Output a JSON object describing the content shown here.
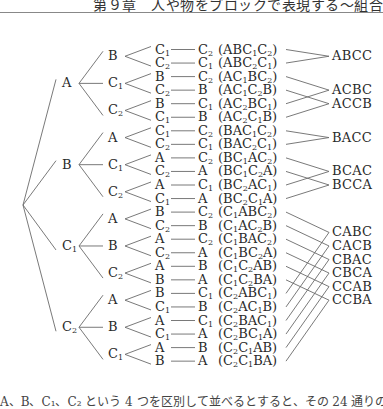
{
  "header": {
    "title": "第９章　人や物をブロックで表現する〜組合"
  },
  "tree": {
    "root": "",
    "level1": [
      "A",
      "B",
      "C1",
      "C2"
    ],
    "branches": [
      {
        "node": "A",
        "children": [
          {
            "node": "B",
            "leaves": [
              {
                "l3": "C1",
                "l4": "C2",
                "seq": "ABC1C2"
              },
              {
                "l3": "C2",
                "l4": "C1",
                "seq": "ABC2C1"
              }
            ]
          },
          {
            "node": "C1",
            "leaves": [
              {
                "l3": "B",
                "l4": "C2",
                "seq": "AC1BC2"
              },
              {
                "l3": "C2",
                "l4": "B",
                "seq": "AC1C2B"
              }
            ]
          },
          {
            "node": "C2",
            "leaves": [
              {
                "l3": "B",
                "l4": "C1",
                "seq": "AC2BC1"
              },
              {
                "l3": "C1",
                "l4": "B",
                "seq": "AC2C1B"
              }
            ]
          }
        ]
      },
      {
        "node": "B",
        "children": [
          {
            "node": "A",
            "leaves": [
              {
                "l3": "C1",
                "l4": "C2",
                "seq": "BAC1C2"
              },
              {
                "l3": "C2",
                "l4": "C1",
                "seq": "BAC2C1"
              }
            ]
          },
          {
            "node": "C1",
            "leaves": [
              {
                "l3": "A",
                "l4": "C2",
                "seq": "BC1AC2"
              },
              {
                "l3": "C2",
                "l4": "A",
                "seq": "BC1C2A"
              }
            ]
          },
          {
            "node": "C2",
            "leaves": [
              {
                "l3": "A",
                "l4": "C1",
                "seq": "BC2AC1"
              },
              {
                "l3": "C1",
                "l4": "A",
                "seq": "BC2C1A"
              }
            ]
          }
        ]
      },
      {
        "node": "C1",
        "children": [
          {
            "node": "A",
            "leaves": [
              {
                "l3": "B",
                "l4": "C2",
                "seq": "C1ABC2"
              },
              {
                "l3": "C2",
                "l4": "B",
                "seq": "C1AC2B"
              }
            ]
          },
          {
            "node": "B",
            "leaves": [
              {
                "l3": "A",
                "l4": "C2",
                "seq": "C1BAC2"
              },
              {
                "l3": "C2",
                "l4": "A",
                "seq": "C1BC2A"
              }
            ]
          },
          {
            "node": "C2",
            "leaves": [
              {
                "l3": "A",
                "l4": "B",
                "seq": "C1C2AB"
              },
              {
                "l3": "B",
                "l4": "A",
                "seq": "C1C2BA"
              }
            ]
          }
        ]
      },
      {
        "node": "C2",
        "children": [
          {
            "node": "A",
            "leaves": [
              {
                "l3": "B",
                "l4": "C1",
                "seq": "C2ABC1"
              },
              {
                "l3": "C1",
                "l4": "B",
                "seq": "C2AC1B"
              }
            ]
          },
          {
            "node": "B",
            "leaves": [
              {
                "l3": "A",
                "l4": "C1",
                "seq": "C2BAC1"
              },
              {
                "l3": "C1",
                "l4": "A",
                "seq": "C2BC1A"
              }
            ]
          },
          {
            "node": "C1",
            "leaves": [
              {
                "l3": "A",
                "l4": "B",
                "seq": "C2C1AB"
              },
              {
                "l3": "B",
                "l4": "A",
                "seq": "C2C1BA"
              }
            ]
          }
        ]
      }
    ],
    "results": [
      {
        "label": "ABCC",
        "rows": [
          0,
          1
        ],
        "row_pos": 0.5
      },
      {
        "label": "ACBC",
        "rows": [
          2,
          4
        ],
        "row_pos": 3
      },
      {
        "label": "ACCB",
        "rows": [
          3,
          5
        ],
        "row_pos": 4
      },
      {
        "label": "BACC",
        "rows": [
          6,
          7
        ],
        "row_pos": 6.5
      },
      {
        "label": "BCAC",
        "rows": [
          8,
          10
        ],
        "row_pos": 9
      },
      {
        "label": "BCCA",
        "rows": [
          9,
          11
        ],
        "row_pos": 10
      },
      {
        "label": "CABC",
        "rows": [
          12,
          18
        ],
        "row_pos": 13.5
      },
      {
        "label": "CACB",
        "rows": [
          13,
          19
        ],
        "row_pos": 14.5
      },
      {
        "label": "CBAC",
        "rows": [
          14,
          20
        ],
        "row_pos": 15.5
      },
      {
        "label": "CBCA",
        "rows": [
          15,
          21
        ],
        "row_pos": 16.5
      },
      {
        "label": "CCAB",
        "rows": [
          16,
          22
        ],
        "row_pos": 17.5
      },
      {
        "label": "CCBA",
        "rows": [
          17,
          23
        ],
        "row_pos": 18.5
      }
    ]
  },
  "footer": {
    "text": "A、B、C₁、C₂ という 4 つを区別して並べるとすると、その 24 通りの全ての中から並べ方..."
  },
  "colors": {
    "line": "#6a6a6a",
    "text": "#2a2a2a"
  }
}
